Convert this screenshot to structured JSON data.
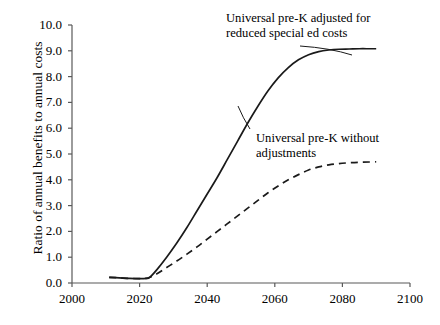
{
  "chart_data": {
    "type": "line",
    "title": "",
    "xlabel": "",
    "ylabel": "Ratio of annual benefits to annual costs",
    "xlim": [
      2000,
      2100
    ],
    "ylim": [
      0.0,
      10.0
    ],
    "xticks": [
      2000,
      2020,
      2040,
      2060,
      2080,
      2100
    ],
    "xtick_labels": [
      "2000",
      "2020",
      "2040",
      "2060",
      "2080",
      "2100"
    ],
    "yticks": [
      0.0,
      1.0,
      2.0,
      3.0,
      4.0,
      5.0,
      6.0,
      7.0,
      8.0,
      9.0,
      10.0
    ],
    "ytick_labels": [
      "0.0",
      "1.0",
      "2.0",
      "3.0",
      "4.0",
      "5.0",
      "6.0",
      "7.0",
      "8.0",
      "9.0",
      "10.0"
    ],
    "grid": false,
    "legend_position": "inline-annotations",
    "series": [
      {
        "name": "Universal pre-K adjusted for reduced special ed costs",
        "style": "solid",
        "color": "#1a1a1a",
        "x": [
          2011,
          2014,
          2017,
          2020,
          2022,
          2023,
          2025,
          2028,
          2031,
          2034,
          2037,
          2040,
          2043,
          2046,
          2049,
          2052,
          2055,
          2058,
          2061,
          2064,
          2067,
          2070,
          2073,
          2076,
          2079,
          2082,
          2085,
          2088,
          2090
        ],
        "values": [
          0.22,
          0.2,
          0.18,
          0.17,
          0.18,
          0.22,
          0.5,
          1.0,
          1.55,
          2.15,
          2.8,
          3.45,
          4.1,
          4.8,
          5.5,
          6.2,
          6.85,
          7.45,
          7.95,
          8.35,
          8.65,
          8.85,
          8.97,
          9.03,
          9.06,
          9.07,
          9.08,
          9.08,
          9.08
        ]
      },
      {
        "name": "Universal pre-K without adjustments",
        "style": "dashed",
        "color": "#1a1a1a",
        "x": [
          2011,
          2014,
          2017,
          2020,
          2022,
          2023,
          2025,
          2028,
          2031,
          2034,
          2037,
          2040,
          2043,
          2046,
          2049,
          2052,
          2055,
          2058,
          2061,
          2064,
          2067,
          2070,
          2073,
          2076,
          2079,
          2082,
          2085,
          2088,
          2090
        ],
        "values": [
          0.22,
          0.2,
          0.18,
          0.17,
          0.18,
          0.22,
          0.35,
          0.6,
          0.85,
          1.12,
          1.4,
          1.7,
          2.0,
          2.3,
          2.6,
          2.9,
          3.2,
          3.5,
          3.76,
          4.0,
          4.2,
          4.38,
          4.5,
          4.58,
          4.63,
          4.66,
          4.68,
          4.69,
          4.7
        ]
      }
    ],
    "annotations": [
      {
        "id": "annot-solid",
        "line1": "Universal pre-K adjusted for",
        "line2": "reduced special ed costs"
      },
      {
        "id": "annot-dashed",
        "line1": "Universal pre-K without",
        "line2": "adjustments"
      }
    ],
    "axis_color": "#595959",
    "line_color": "#1a1a1a"
  }
}
